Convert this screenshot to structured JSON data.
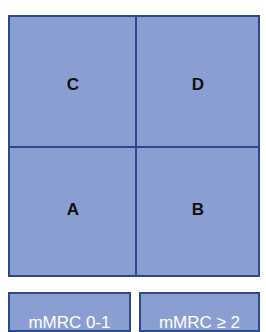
{
  "quadrants": {
    "top_left": "C",
    "top_right": "D",
    "bottom_left": "A",
    "bottom_right": "B"
  },
  "legend": {
    "left": "mMRC 0-1",
    "right": "mMRC ≥ 2"
  },
  "colors": {
    "fill": "#8a9ed2",
    "border": "#2b4a8e",
    "label": "#111111",
    "legend_text": "#ffffff"
  }
}
